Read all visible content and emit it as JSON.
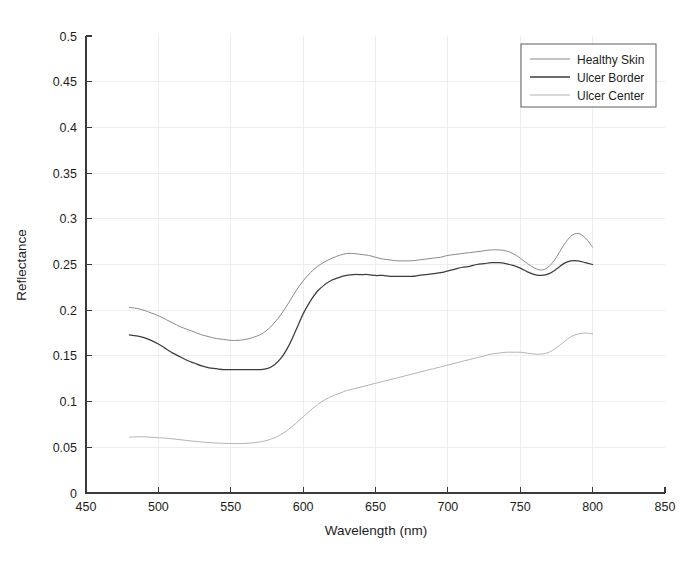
{
  "chart_data": {
    "type": "line",
    "title": "",
    "xlabel": "Wavelength (nm)",
    "ylabel": "Reflectance",
    "xlim": [
      450,
      850
    ],
    "ylim": [
      0,
      0.5
    ],
    "xticks": [
      450,
      500,
      550,
      600,
      650,
      700,
      750,
      800,
      850
    ],
    "yticks": [
      0,
      0.05,
      0.1,
      0.15,
      0.2,
      0.25,
      0.3,
      0.35,
      0.4,
      0.45,
      0.5
    ],
    "xtick_labels": [
      "450",
      "500",
      "550",
      "600",
      "650",
      "700",
      "750",
      "800",
      "850"
    ],
    "ytick_labels": [
      "0",
      "0.05",
      "0.1",
      "0.15",
      "0.2",
      "0.25",
      "0.3",
      "0.35",
      "0.4",
      "0.45",
      "0.5"
    ],
    "grid": true,
    "legend_position": "upper right",
    "x": [
      480,
      485,
      490,
      495,
      500,
      505,
      510,
      515,
      520,
      525,
      530,
      535,
      540,
      545,
      550,
      555,
      560,
      565,
      570,
      575,
      580,
      585,
      590,
      595,
      600,
      605,
      610,
      615,
      620,
      625,
      630,
      635,
      640,
      645,
      650,
      655,
      660,
      665,
      670,
      675,
      680,
      685,
      690,
      695,
      700,
      705,
      710,
      715,
      720,
      725,
      730,
      735,
      740,
      745,
      750,
      755,
      760,
      765,
      770,
      775,
      780,
      785,
      790,
      795,
      800
    ],
    "series": [
      {
        "name": "Healthy Skin",
        "color": "#8a8a8a",
        "values": [
          0.203,
          0.202,
          0.2,
          0.197,
          0.194,
          0.19,
          0.186,
          0.182,
          0.179,
          0.176,
          0.173,
          0.171,
          0.169,
          0.168,
          0.167,
          0.167,
          0.168,
          0.17,
          0.173,
          0.178,
          0.186,
          0.196,
          0.208,
          0.221,
          0.232,
          0.241,
          0.248,
          0.253,
          0.257,
          0.26,
          0.262,
          0.262,
          0.261,
          0.26,
          0.258,
          0.256,
          0.255,
          0.254,
          0.254,
          0.254,
          0.255,
          0.256,
          0.257,
          0.258,
          0.26,
          0.261,
          0.262,
          0.263,
          0.264,
          0.265,
          0.266,
          0.266,
          0.265,
          0.262,
          0.257,
          0.251,
          0.246,
          0.244,
          0.248,
          0.258,
          0.271,
          0.281,
          0.284,
          0.279,
          0.269
        ]
      },
      {
        "name": "Ulcer Border",
        "color": "#3d3d3d",
        "values": [
          0.173,
          0.172,
          0.17,
          0.167,
          0.163,
          0.158,
          0.153,
          0.149,
          0.145,
          0.142,
          0.139,
          0.137,
          0.136,
          0.135,
          0.135,
          0.135,
          0.135,
          0.135,
          0.135,
          0.136,
          0.14,
          0.148,
          0.161,
          0.178,
          0.196,
          0.21,
          0.221,
          0.228,
          0.233,
          0.236,
          0.238,
          0.239,
          0.239,
          0.239,
          0.238,
          0.238,
          0.237,
          0.237,
          0.237,
          0.237,
          0.238,
          0.239,
          0.24,
          0.241,
          0.243,
          0.245,
          0.247,
          0.248,
          0.25,
          0.251,
          0.252,
          0.252,
          0.251,
          0.249,
          0.246,
          0.242,
          0.239,
          0.238,
          0.24,
          0.245,
          0.251,
          0.254,
          0.254,
          0.252,
          0.25
        ]
      },
      {
        "name": "Ulcer Center",
        "color": "#b4b4b4",
        "values": [
          0.061,
          0.0615,
          0.0615,
          0.061,
          0.0605,
          0.06,
          0.0592,
          0.0583,
          0.0574,
          0.0566,
          0.0558,
          0.0552,
          0.0547,
          0.0543,
          0.0541,
          0.054,
          0.0542,
          0.0548,
          0.0558,
          0.0575,
          0.0602,
          0.0643,
          0.0697,
          0.0762,
          0.0833,
          0.0903,
          0.0967,
          0.102,
          0.106,
          0.109,
          0.112,
          0.114,
          0.116,
          0.118,
          0.12,
          0.122,
          0.124,
          0.126,
          0.128,
          0.13,
          0.132,
          0.134,
          0.136,
          0.138,
          0.14,
          0.142,
          0.144,
          0.146,
          0.148,
          0.15,
          0.152,
          0.153,
          0.154,
          0.154,
          0.154,
          0.153,
          0.152,
          0.152,
          0.154,
          0.159,
          0.165,
          0.171,
          0.174,
          0.175,
          0.174
        ]
      }
    ]
  },
  "legend": {
    "entries": [
      {
        "label": "Healthy Skin"
      },
      {
        "label": "Ulcer Border"
      },
      {
        "label": "Ulcer Center"
      }
    ]
  }
}
